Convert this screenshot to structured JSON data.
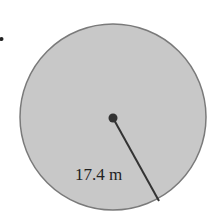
{
  "diagram": {
    "type": "circle-radius",
    "radius_label": "17.4 m",
    "colors": {
      "fill": "#c8c8c8",
      "stroke": "#777777",
      "line": "#333333",
      "center_dot": "#333333"
    }
  }
}
